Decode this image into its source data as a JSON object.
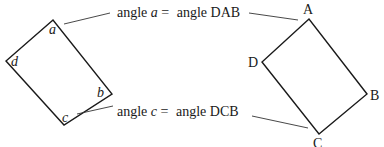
{
  "diagram": {
    "left_shape": {
      "corner_labels": {
        "a": "a",
        "b": "b",
        "c": "c",
        "d": "d"
      }
    },
    "right_shape": {
      "vertex_labels": {
        "A": "A",
        "B": "B",
        "C": "C",
        "D": "D"
      }
    },
    "annotations": [
      {
        "prefix": "angle ",
        "var": "a",
        "eq": " = ",
        "rhs": "angle DAB"
      },
      {
        "prefix": "angle ",
        "var": "c",
        "eq": " = ",
        "rhs": "angle DCB"
      }
    ]
  }
}
